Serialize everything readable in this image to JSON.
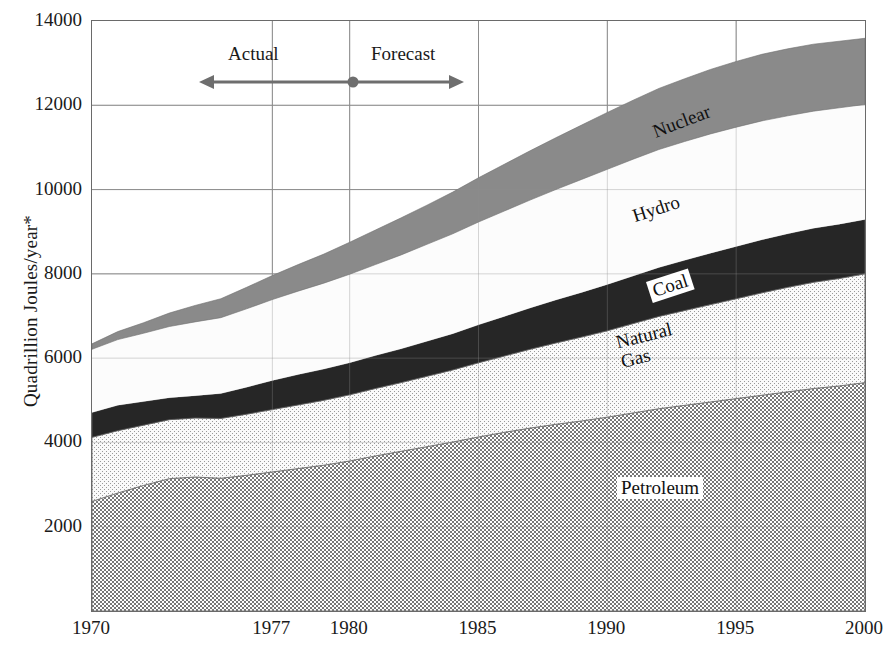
{
  "chart_data": {
    "type": "area",
    "title": "",
    "subtitle": "",
    "xlabel": "",
    "ylabel": "Quadrillion Joules/year*",
    "stacked": true,
    "grid": true,
    "legend_position": "inline-band-labels",
    "xlim": [
      1970,
      2000
    ],
    "ylim": [
      0,
      14000
    ],
    "xticks": [
      1970,
      1977,
      1980,
      1985,
      1990,
      1995,
      2000
    ],
    "xticklabels": [
      "1970",
      "1977",
      "1980",
      "1985",
      "1990",
      "1995",
      "2000"
    ],
    "yticks": [
      2000,
      4000,
      6000,
      8000,
      10000,
      12000,
      14000
    ],
    "yticklabels": [
      "2000",
      "4000",
      "6000",
      "8000",
      "10000",
      "12000",
      "14000"
    ],
    "x": [
      1970,
      1971,
      1972,
      1973,
      1974,
      1975,
      1976,
      1977,
      1978,
      1979,
      1980,
      1981,
      1982,
      1983,
      1984,
      1985,
      1986,
      1987,
      1988,
      1989,
      1990,
      1991,
      1992,
      1993,
      1994,
      1995,
      1996,
      1997,
      1998,
      1999,
      2000
    ],
    "series": [
      {
        "name": "Petroleum",
        "fill": "dense-checker",
        "color": "#9d9d9d",
        "values": [
          2600,
          2800,
          2980,
          3140,
          3180,
          3150,
          3220,
          3300,
          3380,
          3460,
          3560,
          3680,
          3790,
          3900,
          4010,
          4130,
          4240,
          4340,
          4430,
          4510,
          4600,
          4700,
          4800,
          4880,
          4960,
          5040,
          5120,
          5200,
          5280,
          5340,
          5420
        ]
      },
      {
        "name": "Natural Gas",
        "fill": "light-stipple",
        "color": "#ededed",
        "values": [
          1520,
          1480,
          1430,
          1400,
          1400,
          1420,
          1450,
          1480,
          1510,
          1540,
          1570,
          1600,
          1630,
          1670,
          1710,
          1760,
          1810,
          1870,
          1930,
          1990,
          2050,
          2120,
          2190,
          2250,
          2310,
          2370,
          2430,
          2480,
          2520,
          2550,
          2580
        ]
      },
      {
        "name": "Coal",
        "fill": "solid",
        "color": "#262626",
        "values": [
          590,
          600,
          560,
          520,
          530,
          590,
          640,
          690,
          720,
          740,
          760,
          780,
          800,
          830,
          860,
          900,
          940,
          980,
          1020,
          1060,
          1100,
          1130,
          1160,
          1190,
          1220,
          1240,
          1260,
          1270,
          1280,
          1290,
          1290
        ]
      },
      {
        "name": "Hydro",
        "fill": "solid",
        "color": "#fcfcfc",
        "values": [
          1500,
          1560,
          1620,
          1690,
          1750,
          1800,
          1860,
          1920,
          1980,
          2040,
          2100,
          2160,
          2230,
          2300,
          2370,
          2440,
          2500,
          2560,
          2620,
          2680,
          2730,
          2770,
          2800,
          2820,
          2830,
          2830,
          2820,
          2800,
          2780,
          2760,
          2730
        ]
      },
      {
        "name": "Nuclear",
        "fill": "solid",
        "color": "#8a8a8a",
        "values": [
          130,
          190,
          250,
          320,
          390,
          450,
          510,
          570,
          630,
          690,
          760,
          820,
          880,
          930,
          990,
          1050,
          1110,
          1170,
          1230,
          1290,
          1350,
          1400,
          1450,
          1490,
          1530,
          1560,
          1580,
          1590,
          1590,
          1580,
          1570
        ]
      }
    ],
    "totals_note": "Stacked totals: 1970 ≈ 6340, 1980 ≈ 8750, 1990 ≈ 11830, 2000 ≈ 13590",
    "annotations": [
      {
        "name": "actual",
        "text": "Actual",
        "x_range": [
          1973,
          1980
        ],
        "y": 12800
      },
      {
        "name": "forecast",
        "text": "Forecast",
        "x_range": [
          1980,
          1985
        ],
        "y": 12800
      },
      {
        "name": "divider-dot",
        "text": "",
        "x": 1980,
        "y": 12500
      }
    ]
  },
  "axis": {
    "y_title": "Quadrillion Joules/year*"
  },
  "annotation": {
    "actual_label": "Actual",
    "forecast_label": "Forecast"
  },
  "band_labels": {
    "nuclear": "Nuclear",
    "hydro": "Hydro",
    "coal": "Coal",
    "natural_gas": "Natural Gas",
    "petroleum": "Petroleum"
  },
  "colors": {
    "nuclear": "#8a8a8a",
    "hydro": "#fcfcfc",
    "coal": "#262626",
    "natural_gas": "#ededed",
    "petroleum": "#9d9d9d",
    "grid": "#8d8d8d",
    "frame": "#6a6a6a",
    "annotation_arrow": "#6e6e6e",
    "text": "#1a1a1a"
  }
}
